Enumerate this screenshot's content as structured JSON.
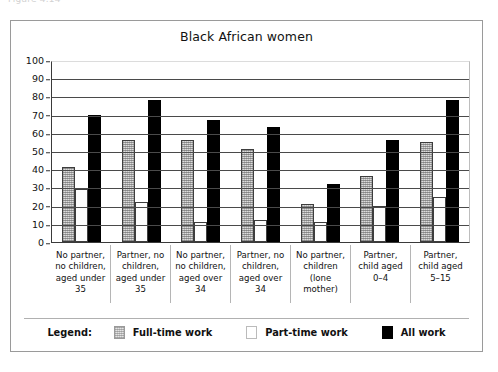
{
  "caption_fragment": "Figure 4.14",
  "figure": {
    "title": "Black African women",
    "legend": {
      "title": "Legend:",
      "entries": [
        {
          "label": "Full-time work",
          "swatch": "light-gray-hatched",
          "color": "#dcdcdc"
        },
        {
          "label": "Part-time work",
          "swatch": "white",
          "color": "#ffffff"
        },
        {
          "label": "All work",
          "swatch": "black",
          "color": "#000000"
        }
      ]
    }
  },
  "chart_data": {
    "type": "bar",
    "title": "Black African women",
    "xlabel": "",
    "ylabel": "",
    "ylim": [
      0,
      100
    ],
    "yticks": [
      0,
      10,
      20,
      30,
      40,
      50,
      60,
      70,
      80,
      90,
      100
    ],
    "grid": true,
    "legend_position": "bottom",
    "categories": [
      "No partner, no children, aged under 35",
      "Partner, no children, aged under 35",
      "No partner, no children, aged over 34",
      "Partner, no children, aged over 34",
      "No partner, children (lone mother)",
      "Partner, child aged 0–4",
      "Partner, child aged 5–15"
    ],
    "category_lines": [
      [
        "No partner,",
        "no children,",
        "aged under",
        "35"
      ],
      [
        "Partner, no",
        "children,",
        "aged under",
        "35"
      ],
      [
        "No partner,",
        "no children,",
        "aged over",
        "34"
      ],
      [
        "Partner, no",
        "children,",
        "aged over",
        "34"
      ],
      [
        "No partner,",
        "children",
        "(lone",
        "mother)"
      ],
      [
        "Partner,",
        "child aged",
        "0–4"
      ],
      [
        "Partner,",
        "child aged",
        "5–15"
      ]
    ],
    "series": [
      {
        "name": "Full-time work",
        "values": [
          41,
          56,
          56,
          51,
          21,
          36,
          55
        ]
      },
      {
        "name": "Part-time work",
        "values": [
          29,
          22,
          11,
          12,
          11,
          20,
          25
        ]
      },
      {
        "name": "All work",
        "values": [
          70,
          78,
          67,
          63,
          32,
          56,
          78
        ]
      }
    ]
  }
}
